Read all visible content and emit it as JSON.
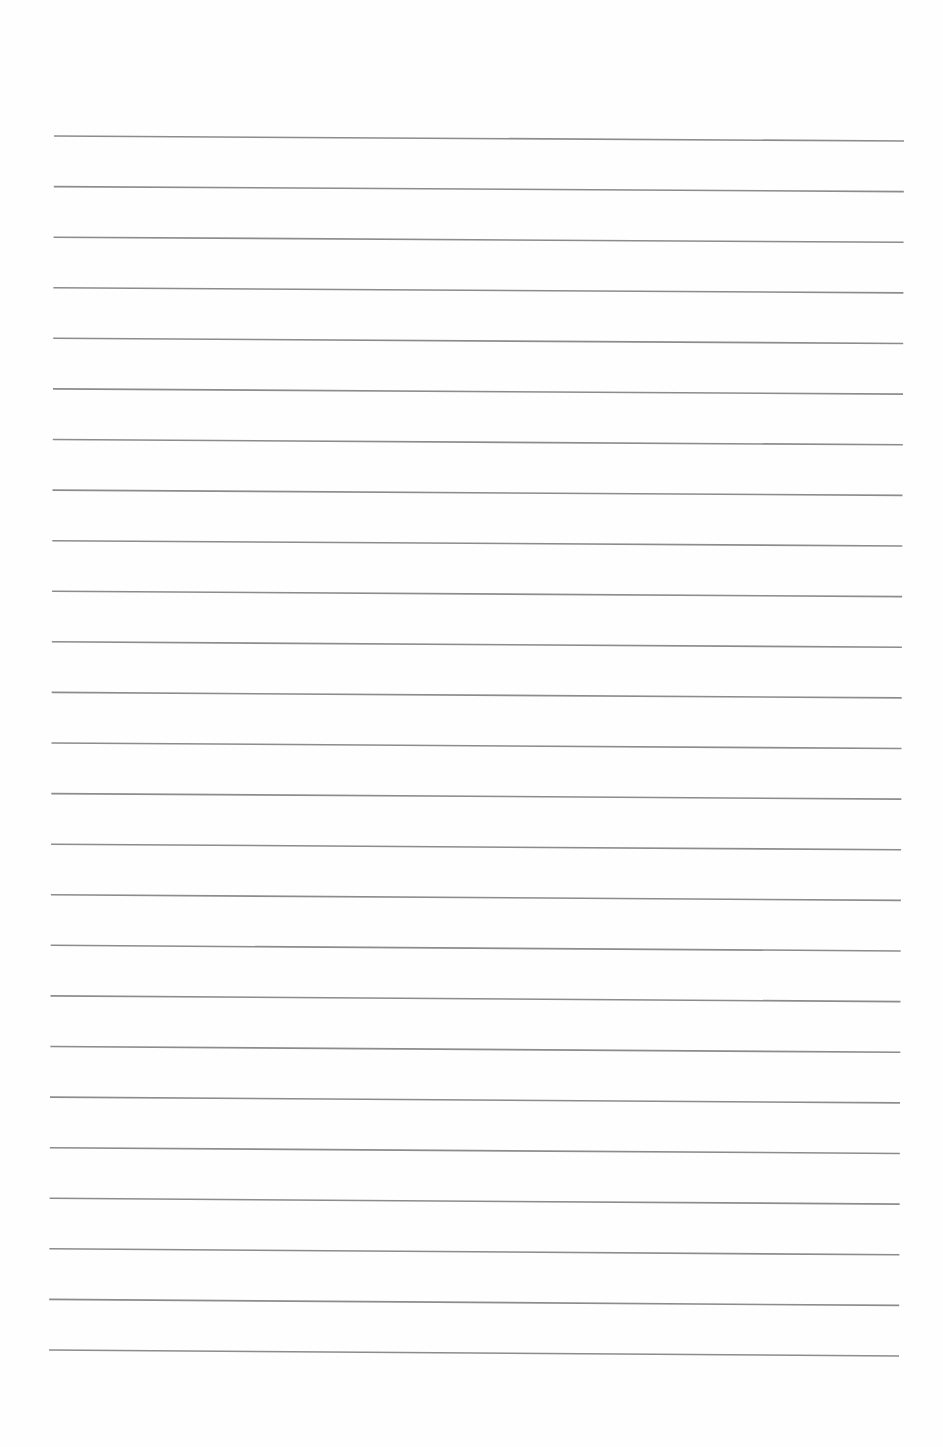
{
  "page": {
    "type": "ruled-paper",
    "background_color": "#fefefe",
    "line_color": "#8c8c8c",
    "line_width": 1.6,
    "line_count": 25,
    "first_line": {
      "x1": 54,
      "y1": 136,
      "x2": 904,
      "y2": 141
    },
    "last_line": {
      "x1": 49,
      "y1": 1350,
      "x2": 899,
      "y2": 1356
    },
    "line_spacing": 50.6
  }
}
